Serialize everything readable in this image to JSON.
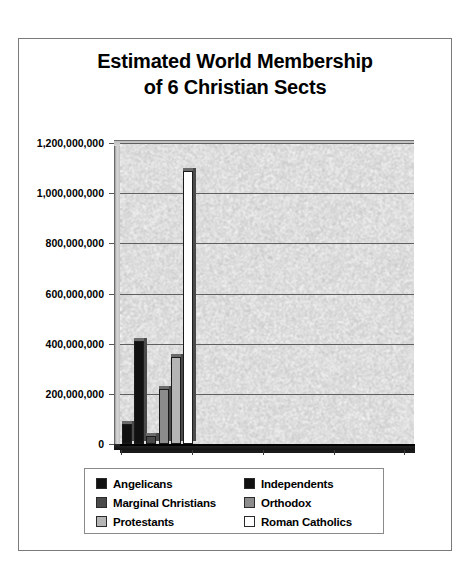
{
  "chart_data": {
    "type": "bar",
    "title": "Estimated World Membership of 6 Christian Sects",
    "title_line1": "Estimated World Membership",
    "title_line2": "of 6 Christian Sects",
    "xlabel": "",
    "ylabel": "",
    "ylim": [
      0,
      1200000000
    ],
    "grid": true,
    "legend_position": "bottom",
    "categories": [
      "Angelicans",
      "Independents",
      "Marginal Christians",
      "Orthodox",
      "Protestants",
      "Roman Catholics"
    ],
    "values": [
      78000000,
      410000000,
      33000000,
      220000000,
      345000000,
      1090000000
    ],
    "colors": [
      "#111111",
      "#111111",
      "#4a4a4a",
      "#8c8c8c",
      "#b5b5b5",
      "#ffffff"
    ],
    "ytick_labels": [
      "1,200,000,000",
      "1,000,000,000",
      "800,000,000",
      "600,000,000",
      "400,000,000",
      "200,000,000",
      "0"
    ],
    "ytick_values": [
      1200000000,
      1000000000,
      800000000,
      600000000,
      400000000,
      200000000,
      0
    ],
    "series": [
      {
        "name": "Angelicans",
        "value": 78000000,
        "color": "#111111"
      },
      {
        "name": "Independents",
        "value": 410000000,
        "color": "#111111"
      },
      {
        "name": "Marginal Christians",
        "value": 33000000,
        "color": "#4a4a4a"
      },
      {
        "name": "Orthodox",
        "value": 220000000,
        "color": "#8c8c8c"
      },
      {
        "name": "Protestants",
        "value": 345000000,
        "color": "#b5b5b5"
      },
      {
        "name": "Roman Catholics",
        "value": 1090000000,
        "color": "#ffffff"
      }
    ]
  },
  "legend": {
    "rows": [
      {
        "left": {
          "label": "Angelicans",
          "color": "#111111"
        },
        "right": {
          "label": "Independents",
          "color": "#111111"
        }
      },
      {
        "left": {
          "label": "Marginal Christians",
          "color": "#4a4a4a"
        },
        "right": {
          "label": "Orthodox",
          "color": "#8c8c8c"
        }
      },
      {
        "left": {
          "label": "Protestants",
          "color": "#b5b5b5"
        },
        "right": {
          "label": "Roman Catholics",
          "color": "#ffffff"
        }
      }
    ]
  },
  "style": {
    "plot_background": "#d2d2d2",
    "gridline_color": "#5f5f5f",
    "axis_color": "#000000",
    "frame_color": "#7a7a7a",
    "text_color": "#000000"
  }
}
